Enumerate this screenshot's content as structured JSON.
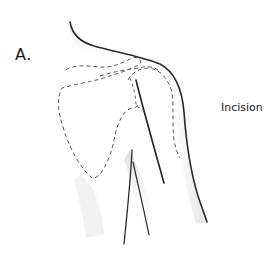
{
  "figure": {
    "panel_label": "A.",
    "annotations": [
      {
        "label": "Incision"
      }
    ],
    "colors": {
      "background": "#ffffff",
      "outline": "#2b2b2b",
      "dashed_outline": "#5a5a5a",
      "incision": "#222222",
      "shading": "#d9d9d9"
    }
  }
}
